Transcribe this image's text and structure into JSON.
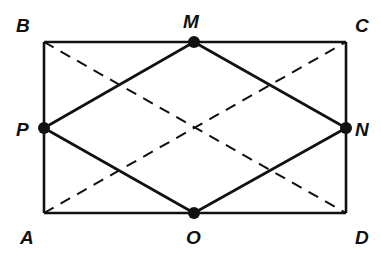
{
  "diagram": {
    "type": "geometry",
    "points": [
      {
        "id": "B",
        "label": "B",
        "x": 44,
        "y": 42,
        "lx": 16,
        "ly": 16,
        "marked": false
      },
      {
        "id": "M",
        "label": "M",
        "x": 194,
        "y": 42,
        "lx": 183,
        "ly": 12,
        "marked": true
      },
      {
        "id": "C",
        "label": "C",
        "x": 346,
        "y": 42,
        "lx": 355,
        "ly": 16,
        "marked": false
      },
      {
        "id": "P",
        "label": "P",
        "x": 44,
        "y": 128,
        "lx": 16,
        "ly": 120,
        "marked": true
      },
      {
        "id": "N",
        "label": "N",
        "x": 346,
        "y": 128,
        "lx": 355,
        "ly": 120,
        "marked": true
      },
      {
        "id": "A",
        "label": "A",
        "x": 44,
        "y": 213,
        "lx": 20,
        "ly": 228,
        "marked": false
      },
      {
        "id": "O",
        "label": "O",
        "x": 194,
        "y": 213,
        "lx": 186,
        "ly": 228,
        "marked": true
      },
      {
        "id": "D",
        "label": "D",
        "x": 346,
        "y": 213,
        "lx": 355,
        "ly": 228,
        "marked": false
      }
    ],
    "solid_segments": [
      [
        "A",
        "B"
      ],
      [
        "B",
        "C"
      ],
      [
        "C",
        "D"
      ],
      [
        "D",
        "A"
      ],
      [
        "M",
        "N"
      ],
      [
        "N",
        "O"
      ],
      [
        "O",
        "P"
      ],
      [
        "P",
        "M"
      ]
    ],
    "dashed_segments": [
      [
        "A",
        "C"
      ],
      [
        "B",
        "D"
      ]
    ],
    "colors": {
      "stroke": "#111111",
      "background": "#ffffff"
    }
  }
}
